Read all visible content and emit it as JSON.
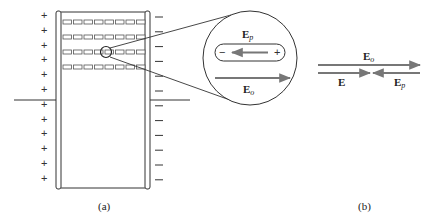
{
  "figure": {
    "panel_a": {
      "caption": "(a)",
      "left_plate_sign": "+",
      "right_plate_sign": "−",
      "left_charges_count": 12,
      "right_charges_count": 12,
      "molecule_rows": 4,
      "molecules_per_row": 8
    },
    "magnified_view": {
      "top_label_main": "E",
      "top_label_sub": "p",
      "bottom_label_main": "E",
      "bottom_label_sub": "o",
      "molecule_left_sign": "−",
      "molecule_right_sign": "+"
    },
    "panel_b": {
      "caption": "(b)",
      "top_arrow_label_main": "E",
      "top_arrow_label_sub": "o",
      "resultant_label": "E",
      "polarization_label_main": "E",
      "polarization_label_sub": "p"
    },
    "colors": {
      "line": "#333333",
      "arrow": "#777777",
      "molecule": "#555555"
    }
  }
}
